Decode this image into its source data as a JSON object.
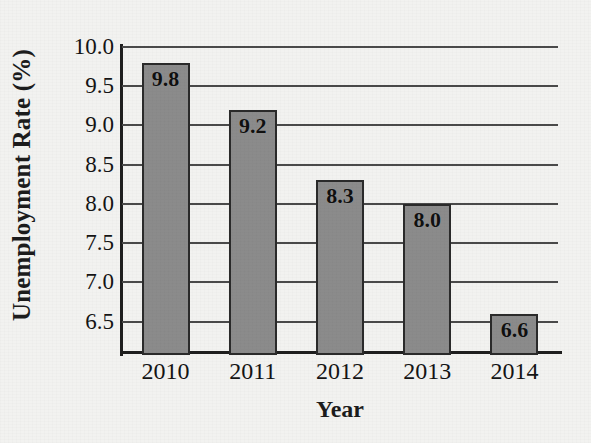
{
  "chart_data": {
    "type": "bar",
    "title": "",
    "xlabel": "Year",
    "ylabel": "Unemployment Rate (%)",
    "categories": [
      "2010",
      "2011",
      "2012",
      "2013",
      "2014"
    ],
    "values": [
      9.8,
      9.2,
      8.3,
      8.0,
      6.6
    ],
    "value_labels": [
      "9.8",
      "9.2",
      "8.3",
      "8.0",
      "6.6"
    ],
    "ylim": [
      6.1,
      10.0
    ],
    "ytick_labels": [
      "10.0",
      "9.5",
      "9.0",
      "8.5",
      "8.0",
      "7.5",
      "7.0",
      "6.5"
    ],
    "yticks": [
      10.0,
      9.5,
      9.0,
      8.5,
      8.0,
      7.5,
      7.0,
      6.5
    ],
    "grid": true,
    "grid_axis": "y",
    "legend": false,
    "legend_position": "none",
    "bar_color": "#8b8b8b",
    "bar_edge_color": "#2a2a2a",
    "background_color": "#f2f2f0",
    "axis_color": "#1e1e1e",
    "gridline_color": "#4a4a4a",
    "value_label_position": "inside-top"
  }
}
